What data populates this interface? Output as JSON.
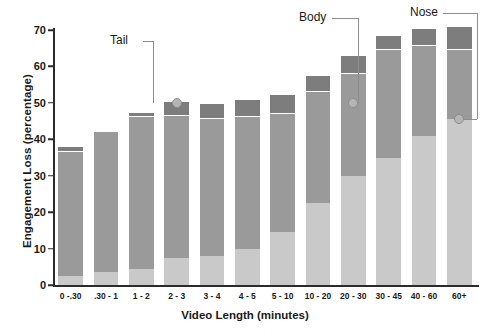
{
  "chart_data": {
    "type": "bar",
    "stacked": true,
    "title": "",
    "xlabel": "Video Length (minutes)",
    "ylabel": "Engagement Loss (percentage)",
    "ylim": [
      0,
      70
    ],
    "yticks": [
      0,
      10,
      20,
      30,
      40,
      50,
      60,
      70
    ],
    "grid": false,
    "legend": "none",
    "categories": [
      "0 -.30",
      ".30 - 1",
      "1 - 2",
      "2 - 3",
      "3 - 4",
      "4 - 5",
      "5 - 10",
      "10 - 20",
      "20 - 30",
      "30 - 45",
      "40 - 60",
      "60+"
    ],
    "series": [
      {
        "name": "Nose",
        "color": "#c9c9c9",
        "values": [
          2.5,
          3.5,
          4.5,
          7.5,
          8.0,
          10.0,
          14.5,
          22.5,
          30.0,
          35.0,
          41.0,
          45.5
        ]
      },
      {
        "name": "Body",
        "color": "#9a9a9a",
        "values": [
          34.0,
          38.5,
          41.5,
          39.0,
          37.5,
          36.0,
          32.5,
          30.5,
          28.0,
          29.5,
          24.5,
          19.0
        ]
      },
      {
        "name": "Tail",
        "color": "#7d7d7d",
        "values": [
          1.0,
          0.0,
          1.0,
          3.5,
          4.0,
          4.5,
          5.0,
          4.0,
          4.5,
          3.5,
          4.5,
          6.0
        ]
      }
    ],
    "totals": [
      37.5,
      42.0,
      47.0,
      50.0,
      49.5,
      50.5,
      52.0,
      57.0,
      62.5,
      68.0,
      70.0,
      70.5
    ],
    "annotations": [
      {
        "label": "Tail",
        "target_category": "2 - 3",
        "target_value": 50.0
      },
      {
        "label": "Body",
        "target_category": "20 - 30",
        "target_value": 50.0
      },
      {
        "label": "Nose",
        "target_category": "60+",
        "target_value": 45.5
      }
    ]
  }
}
